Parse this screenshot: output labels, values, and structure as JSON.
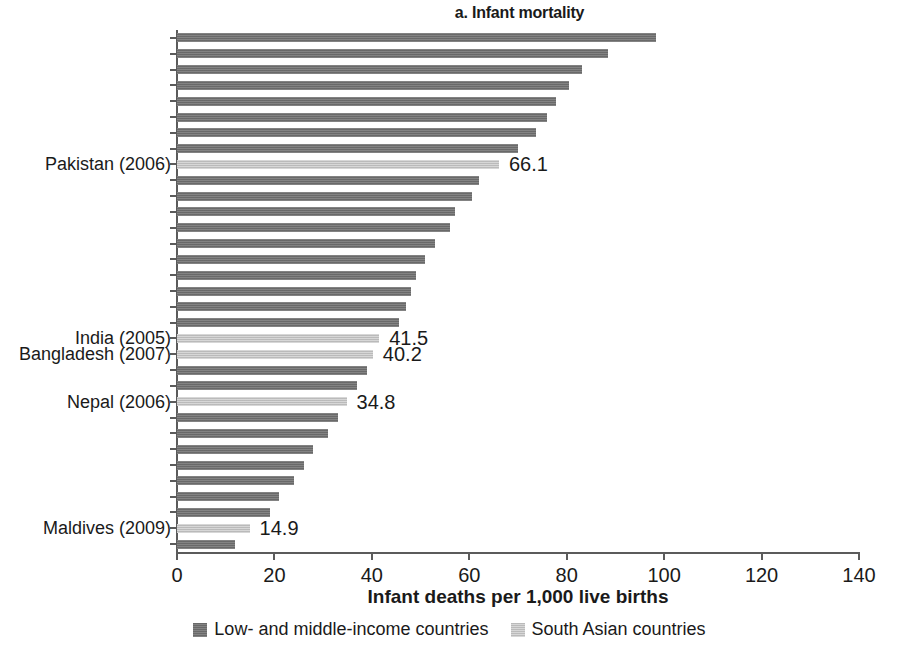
{
  "chart_data": {
    "type": "bar",
    "orientation": "horizontal",
    "title": "a. Infant mortality",
    "xlabel": "Infant deaths per 1,000 live births",
    "ylabel": "",
    "xlim": [
      0,
      140
    ],
    "xticks": [
      0,
      20,
      40,
      60,
      80,
      100,
      120,
      140
    ],
    "xticklabels": [
      "0",
      "20",
      "40",
      "60",
      "80",
      "100",
      "120",
      "140"
    ],
    "grid": false,
    "sorted": "descending",
    "legend": {
      "position": "bottom-center",
      "entries": [
        {
          "label": "Low- and middle-income countries",
          "color": "#6f6f6f",
          "key": "lmi"
        },
        {
          "label": "South Asian countries",
          "color": "#c2c2c2",
          "key": "sa"
        }
      ]
    },
    "categories": [
      "",
      "",
      "",
      "",
      "",
      "",
      "",
      "",
      "Pakistan (2006)",
      "",
      "",
      "",
      "",
      "",
      "",
      "",
      "",
      "",
      "",
      "India (2005)",
      "Bangladesh (2007)",
      "",
      "",
      "Nepal (2006)",
      "",
      "",
      "",
      "",
      "",
      "",
      "",
      "Maldives (2009)",
      ""
    ],
    "values": [
      98.4,
      88.5,
      83.2,
      80.4,
      77.9,
      76.0,
      73.6,
      70.0,
      66.1,
      62.0,
      60.6,
      57.1,
      56.0,
      53.0,
      51.0,
      49.0,
      48.0,
      47.0,
      45.6,
      41.5,
      40.2,
      39.0,
      37.0,
      34.8,
      33.0,
      31.0,
      28.0,
      26.0,
      24.0,
      21.0,
      19.0,
      14.9,
      12.0
    ],
    "series_key": [
      "lmi",
      "lmi",
      "lmi",
      "lmi",
      "lmi",
      "lmi",
      "lmi",
      "lmi",
      "sa",
      "lmi",
      "lmi",
      "lmi",
      "lmi",
      "lmi",
      "lmi",
      "lmi",
      "lmi",
      "lmi",
      "lmi",
      "sa",
      "sa",
      "lmi",
      "lmi",
      "sa",
      "lmi",
      "lmi",
      "lmi",
      "lmi",
      "lmi",
      "lmi",
      "lmi",
      "sa",
      "lmi"
    ],
    "labeled_points": [
      {
        "index": 8,
        "category": "Pakistan (2006)",
        "value": 66.1,
        "value_label": "66.1"
      },
      {
        "index": 19,
        "category": "India (2005)",
        "value": 41.5,
        "value_label": "41.5"
      },
      {
        "index": 20,
        "category": "Bangladesh (2007)",
        "value": 40.2,
        "value_label": "40.2"
      },
      {
        "index": 23,
        "category": "Nepal (2006)",
        "value": 34.8,
        "value_label": "34.8"
      },
      {
        "index": 31,
        "category": "Maldives (2009)",
        "value": 14.9,
        "value_label": "14.9"
      }
    ],
    "colors": {
      "low_and_middle_income": "#6f6f6f",
      "south_asian": "#c2c2c2",
      "axis": "#5b5b5b",
      "text": "#1a1a1a",
      "background": "#ffffff"
    }
  }
}
